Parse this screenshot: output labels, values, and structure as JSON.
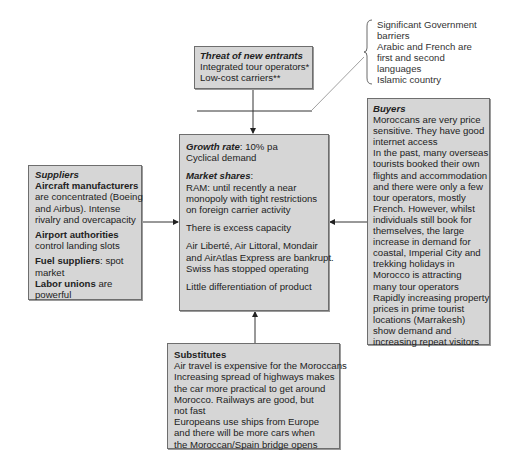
{
  "diagram": {
    "type": "five-forces",
    "threat_of_new_entrants": {
      "title": "Threat of new entrants",
      "lines": [
        "Integrated tour operators*",
        "Low-cost carriers**"
      ]
    },
    "barriers_note": {
      "lines": [
        "Significant Government",
        "barriers",
        "Arabic and French are",
        "first and second",
        "languages",
        "Islamic country"
      ]
    },
    "industry": {
      "growth_label": "Growth rate",
      "growth_value": ": 10% pa",
      "demand": "Cyclical demand",
      "market_shares_label": "Market shares",
      "market_shares_colon": ":",
      "ram_lines": [
        "RAM: until recently a near",
        "monopoly with tight restrictions",
        "on foreign carrier activity"
      ],
      "capacity": "There is excess capacity",
      "bankrupt_lines": [
        "Air Liberté, Air Littoral, Mondair",
        "and AirAtlas Express are bankrupt.",
        "Swiss has stopped operating"
      ],
      "differentiation": "Little differentiation of product"
    },
    "suppliers": {
      "title": "Suppliers",
      "aircraft_label": "Aircraft manufacturers",
      "aircraft_lines": [
        "are concentrated (Boeing",
        "and Airbus). Intense",
        "rivalry and overcapacity"
      ],
      "airport_label": "Airport authorities",
      "airport_lines": [
        "control landing slots"
      ],
      "fuel_label": "Fuel suppliers",
      "fuel_text": ": spot",
      "fuel_lines": [
        "market"
      ],
      "labor_label": "Labor unions",
      "labor_text": " are",
      "labor_lines": [
        "powerful"
      ]
    },
    "buyers": {
      "title": "Buyers",
      "lines": [
        "Moroccans are very price",
        "sensitive. They have good",
        "internet access",
        "In the past, many overseas",
        "tourists booked their own",
        "flights and accommodation",
        "and there were only a few",
        "tour operators, mostly",
        "French. However, whilst",
        "individuals still book for",
        "themselves, the large",
        "increase in demand for",
        "coastal, Imperial City and",
        "trekking holidays in",
        "Morocco is attracting",
        "many tour operators",
        "Rapidly increasing property",
        "prices in prime tourist",
        "locations (Marrakesh)",
        "show demand and",
        "increasing repeat visitors"
      ]
    },
    "substitutes": {
      "title": "Substitutes",
      "lines": [
        "Air travel is expensive for the Moroccans",
        "Increasing spread of highways makes",
        "the car more practical to get around",
        "Morocco. Railways are good, but",
        "not fast",
        "Europeans use ships from Europe",
        "and there will be more cars when",
        "the Moroccan/Spain bridge opens"
      ]
    },
    "colors": {
      "box_fill": "#d6d6d6",
      "box_border": "#6e6e6e",
      "line": "#333333"
    }
  }
}
